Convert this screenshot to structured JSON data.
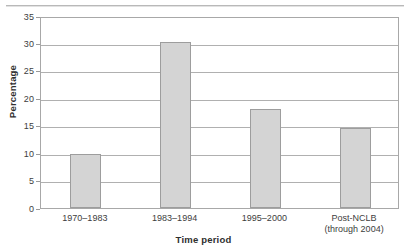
{
  "chart_data": {
    "type": "bar",
    "title": "",
    "xlabel": "Time period",
    "ylabel": "Percentage",
    "categories": [
      "1970–1983",
      "1983–1994",
      "1995–2000",
      "Post-NCLB"
    ],
    "category_sublabels": [
      "",
      "",
      "",
      "(through 2004)"
    ],
    "values": [
      9.8,
      30.2,
      18.1,
      14.6
    ],
    "ylim": [
      0,
      35
    ],
    "yticks": [
      0,
      5,
      10,
      15,
      20,
      25,
      30,
      35
    ],
    "ytick_labels": [
      "0",
      "5",
      "10",
      "15",
      "20",
      "25",
      "30",
      "35"
    ],
    "grid": "horizontal",
    "legend": "none",
    "bar_fill": "#d4d4d4",
    "bar_edge": "#9d9d9d",
    "axis_color": "#a8a8a8",
    "gridline_color": "#b0b0b0"
  }
}
